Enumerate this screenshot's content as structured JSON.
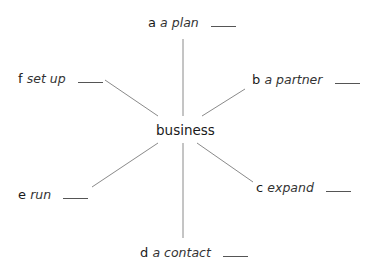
{
  "center": {
    "label": "business"
  },
  "items": [
    {
      "letter": "a",
      "word": "a plan"
    },
    {
      "letter": "b",
      "word": "a partner"
    },
    {
      "letter": "c",
      "word": "expand"
    },
    {
      "letter": "d",
      "word": "a contact"
    },
    {
      "letter": "e",
      "word": "run"
    },
    {
      "letter": "f",
      "word": "set up"
    }
  ],
  "colors": {
    "line": "#8a8a8a",
    "text": "#1a1a1a"
  }
}
